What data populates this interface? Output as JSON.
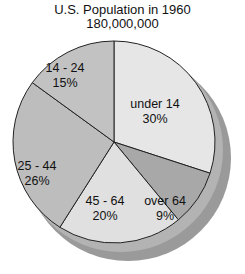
{
  "chart_data": {
    "type": "pie",
    "title": "U.S. Population in 1960",
    "subtitle": "180,000,000",
    "categories": [
      "under 14",
      "over 64",
      "45 - 64",
      "25 - 44",
      "14 - 24"
    ],
    "values": [
      30,
      9,
      20,
      26,
      15
    ],
    "unit": "%",
    "labels": [
      "30%",
      "9%",
      "20%",
      "26%",
      "15%"
    ],
    "start_angle_deg": 0,
    "direction": "clockwise",
    "legend": "none",
    "colors": [
      "#e6e6e6",
      "#a8a8a8",
      "#e0e0e0",
      "#bdbdbd",
      "#c2c2c2"
    ],
    "shadow_color": "#9a9a9a"
  }
}
